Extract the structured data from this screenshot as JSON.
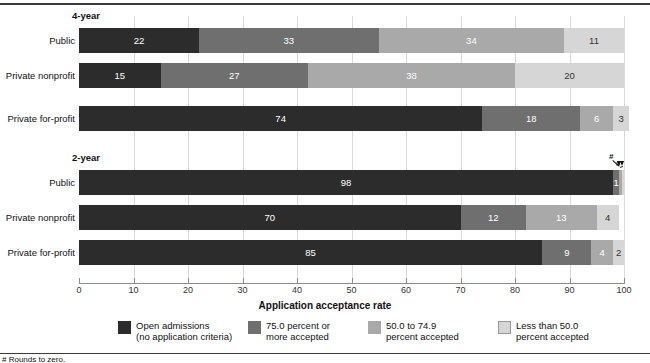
{
  "chart_data": {
    "type": "bar",
    "orientation": "horizontal",
    "stacked": true,
    "title": "",
    "xlabel": "Application acceptance rate",
    "ylabel": "",
    "xlim": [
      0,
      100
    ],
    "xticks": [
      0,
      10,
      20,
      30,
      40,
      50,
      60,
      70,
      80,
      90,
      100
    ],
    "grid": true,
    "legend_position": "bottom",
    "series": [
      {
        "name": "Open admissions (no application criteria)",
        "color": "#2c2c2c",
        "values": [
          22,
          15,
          74,
          98,
          70,
          85
        ]
      },
      {
        "name": "75.0 percent or more accepted",
        "color": "#6f6f6f",
        "values": [
          33,
          27,
          18,
          1,
          12,
          9
        ]
      },
      {
        "name": "50.0 to 74.9 percent accepted",
        "color": "#a9a9a9",
        "values": [
          34,
          38,
          6,
          0,
          13,
          4
        ]
      },
      {
        "name": "Less than 50.0 percent accepted",
        "color": "#d6d6d6",
        "values": [
          11,
          20,
          3,
          0,
          4,
          2
        ]
      }
    ],
    "groups": [
      {
        "label": "4-year",
        "categories": [
          "Public",
          "Private nonprofit",
          "Private for-profit"
        ]
      },
      {
        "label": "2-year",
        "categories": [
          "Public",
          "Private nonprofit",
          "Private for-profit"
        ]
      }
    ],
    "annotations": [
      "#",
      "#"
    ],
    "footnote": "# Rounds to zero."
  },
  "groups": [
    {
      "label": "4-year"
    },
    {
      "label": "2-year"
    }
  ],
  "rows": [
    {
      "label": "Public",
      "segments": [
        {
          "value": "22",
          "pct": 22,
          "class": "c0",
          "show": true
        },
        {
          "value": "33",
          "pct": 33,
          "class": "c1",
          "show": true
        },
        {
          "value": "34",
          "pct": 34,
          "class": "c2",
          "show": true
        },
        {
          "value": "11",
          "pct": 11,
          "class": "c3",
          "show": true
        }
      ]
    },
    {
      "label": "Private nonprofit",
      "segments": [
        {
          "value": "15",
          "pct": 15,
          "class": "c0",
          "show": true
        },
        {
          "value": "27",
          "pct": 27,
          "class": "c1",
          "show": true
        },
        {
          "value": "38",
          "pct": 38,
          "class": "c2",
          "show": true
        },
        {
          "value": "20",
          "pct": 20,
          "class": "c3",
          "show": true
        }
      ]
    },
    {
      "label": "Private for-profit",
      "segments": [
        {
          "value": "74",
          "pct": 74,
          "class": "c0",
          "show": true
        },
        {
          "value": "18",
          "pct": 18,
          "class": "c1",
          "show": true
        },
        {
          "value": "6",
          "pct": 6,
          "class": "c2",
          "show": true
        },
        {
          "value": "3",
          "pct": 3,
          "class": "c3",
          "show": true
        }
      ]
    },
    {
      "label": "Public",
      "segments": [
        {
          "value": "98",
          "pct": 98,
          "class": "c0",
          "show": true
        },
        {
          "value": "1",
          "pct": 1.1,
          "class": "c1",
          "show": true
        },
        {
          "value": "",
          "pct": 0.5,
          "class": "c2",
          "show": false
        },
        {
          "value": "",
          "pct": 0.4,
          "class": "c3",
          "show": false
        }
      ]
    },
    {
      "label": "Private nonprofit",
      "segments": [
        {
          "value": "70",
          "pct": 70,
          "class": "c0",
          "show": true
        },
        {
          "value": "12",
          "pct": 12,
          "class": "c1",
          "show": true
        },
        {
          "value": "13",
          "pct": 13,
          "class": "c2",
          "show": true
        },
        {
          "value": "4",
          "pct": 4,
          "class": "c3",
          "show": true
        }
      ]
    },
    {
      "label": "Private for-profit",
      "segments": [
        {
          "value": "85",
          "pct": 85,
          "class": "c0",
          "show": true
        },
        {
          "value": "9",
          "pct": 9,
          "class": "c1",
          "show": true
        },
        {
          "value": "4",
          "pct": 4,
          "class": "c2",
          "show": true
        },
        {
          "value": "2",
          "pct": 2,
          "class": "c3",
          "show": true
        }
      ]
    }
  ],
  "axis": {
    "title": "Application acceptance rate",
    "ticks": [
      "0",
      "10",
      "20",
      "30",
      "40",
      "50",
      "60",
      "70",
      "80",
      "90",
      "100"
    ]
  },
  "callouts": [
    {
      "label": "#"
    },
    {
      "label": "#"
    }
  ],
  "legend": [
    {
      "class": "c0",
      "line1": "Open admissions",
      "line2": "(no application criteria)"
    },
    {
      "class": "c1",
      "line1": "75.0 percent or",
      "line2": "more accepted"
    },
    {
      "class": "c2",
      "line1": "50.0 to 74.9",
      "line2": "percent accepted"
    },
    {
      "class": "c3",
      "line1": "Less than 50.0",
      "line2": "percent accepted"
    }
  ],
  "footnote": "# Rounds to zero."
}
